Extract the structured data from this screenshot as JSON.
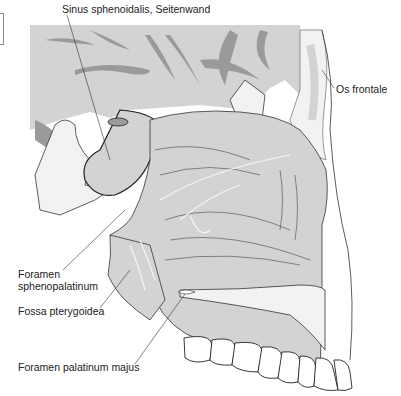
{
  "figure": {
    "type": "anatomical-illustration",
    "colors": {
      "background": "#ffffff",
      "soft_tissue_fill": "#d3d3d3",
      "dark_tissue": "#9a9a9a",
      "outline": "#333333",
      "bone_spongy": "#f2f2f2",
      "highlight_lines": "#f5f5f5"
    }
  },
  "labels": [
    {
      "id": "sinus-sphenoidalis",
      "text": "Sinus sphenoidalis, Seitenwand",
      "x": 62,
      "y": 3
    },
    {
      "id": "os-frontale",
      "text": "Os frontale",
      "x": 336,
      "y": 83
    },
    {
      "id": "foramen-sphenopalatinum-1",
      "text": "Foramen",
      "x": 18,
      "y": 268
    },
    {
      "id": "foramen-sphenopalatinum-2",
      "text": "sphenopalatinum",
      "x": 18,
      "y": 280
    },
    {
      "id": "fossa-pterygoidea",
      "text": "Fossa pterygoidea",
      "x": 18,
      "y": 305
    },
    {
      "id": "foramen-palatinum-majus",
      "text": "Foramen palatinum majus",
      "x": 18,
      "y": 361
    }
  ]
}
